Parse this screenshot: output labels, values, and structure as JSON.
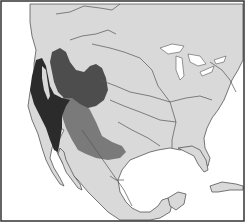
{
  "map": {
    "region": "North America (United States and Mexico)",
    "style": "grayscale outline map",
    "colors": {
      "ocean": "#ffffff",
      "land": "#d9d9d9",
      "border_lines": "#555555",
      "frame": "#333333",
      "range_darkest": "#2b2b2b",
      "range_dark": "#4d4d4d",
      "range_medium": "#7a7a7a",
      "lakes": "#ffffff"
    },
    "layers": [
      {
        "id": "range-coastal",
        "shade": "darkest",
        "description": "Pacific coastal range (California, Baja)"
      },
      {
        "id": "range-great-basin",
        "shade": "dark",
        "description": "Great Basin / Interior West range"
      },
      {
        "id": "range-southwest",
        "shade": "medium",
        "description": "Southwest range (Arizona, New Mexico, Texas)"
      }
    ],
    "features": [
      "Great Lakes",
      "Gulf of Mexico",
      "Florida peninsula",
      "Baja California",
      "Cuba (partial)",
      "Yucatan peninsula"
    ]
  }
}
